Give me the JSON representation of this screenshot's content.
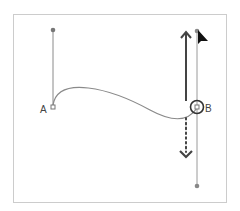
{
  "diagram": {
    "anchors": [
      {
        "label": "A",
        "x": 53,
        "y": 107
      },
      {
        "label": "B",
        "x": 197,
        "y": 106
      }
    ],
    "colors": {
      "frame": "#c8c8c8",
      "curve": "#888888",
      "handle": "#8a8a8a",
      "arrow": "#444444",
      "cursor": "#111111"
    }
  }
}
